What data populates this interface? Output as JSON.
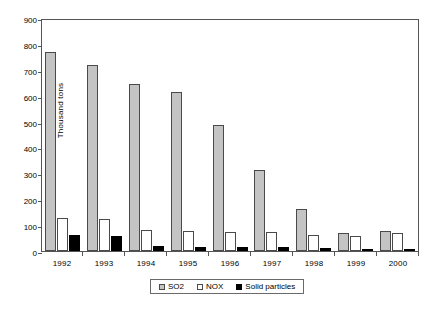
{
  "chart_data": {
    "type": "bar",
    "title": "",
    "subtitle": "",
    "xlabel": "",
    "ylabel": "Thousand tons",
    "ylim": [
      0,
      900
    ],
    "ytick_step": 100,
    "yticks": [
      900,
      800,
      700,
      600,
      500,
      400,
      300,
      200,
      100,
      0
    ],
    "grid": false,
    "legend_position": "bottom",
    "categories": [
      "1992",
      "1993",
      "1994",
      "1995",
      "1996",
      "1997",
      "1998",
      "1999",
      "2000"
    ],
    "series": [
      {
        "name": "SO2",
        "color": "#c4c4c4",
        "values": [
          770,
          720,
          645,
          615,
          485,
          312,
          163,
          68,
          79
        ]
      },
      {
        "name": "NOX",
        "color": "#ffffff",
        "values": [
          129,
          124,
          80,
          78,
          75,
          73,
          61,
          58,
          70
        ]
      },
      {
        "name": "Solid particles",
        "color": "#000000",
        "values": [
          60,
          57,
          20,
          14,
          15,
          15,
          11,
          5,
          6
        ]
      }
    ]
  },
  "legend": {
    "items": [
      {
        "label": "SO2"
      },
      {
        "label": "NOX"
      },
      {
        "label": "Solid particles"
      }
    ]
  }
}
